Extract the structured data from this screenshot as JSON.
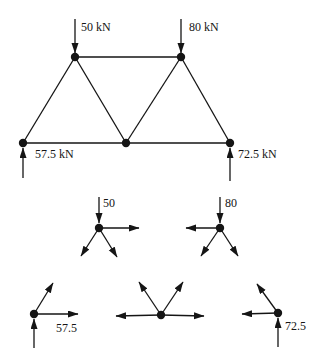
{
  "figure": {
    "type": "truss-joint-free-body-diagram",
    "units": "kN",
    "colors": {
      "ink": "#151515",
      "background": "#ffffff"
    },
    "truss": {
      "nodes": [
        {
          "id": "top-left",
          "x": 75,
          "y": 57
        },
        {
          "id": "top-right",
          "x": 181,
          "y": 57
        },
        {
          "id": "bottom-left",
          "x": 23,
          "y": 143
        },
        {
          "id": "bottom-middle",
          "x": 126,
          "y": 143
        },
        {
          "id": "bottom-right",
          "x": 230,
          "y": 143
        }
      ],
      "members": [
        {
          "name": "member-top-chord",
          "from": "top-left",
          "to": "top-right"
        },
        {
          "name": "member-bottom-chord",
          "from": "bottom-left",
          "to": "bottom-right"
        },
        {
          "name": "member-left-diagonal",
          "from": "bottom-left",
          "to": "top-left"
        },
        {
          "name": "member-mid-left-diagonal",
          "from": "top-left",
          "to": "bottom-middle"
        },
        {
          "name": "member-mid-right-diagonal",
          "from": "bottom-middle",
          "to": "top-right"
        },
        {
          "name": "member-right-diagonal",
          "from": "top-right",
          "to": "bottom-right"
        }
      ],
      "forces": [
        {
          "name": "load-arrow-50kN",
          "label": "50 kN",
          "value": 50,
          "line": [
            75,
            19,
            75,
            53
          ],
          "label_pos": [
            81,
            31
          ]
        },
        {
          "name": "load-arrow-80kN",
          "label": "80 kN",
          "value": 80,
          "line": [
            181,
            19,
            181,
            53
          ],
          "label_pos": [
            189,
            31
          ]
        },
        {
          "name": "reaction-arrow-57-5kN",
          "label": "57.5 kN",
          "value": 57.5,
          "line": [
            23,
            178,
            23,
            148
          ],
          "label_pos": [
            35,
            158
          ]
        },
        {
          "name": "reaction-arrow-72-5kN",
          "label": "72.5 kN",
          "value": 72.5,
          "line": [
            230,
            181,
            230,
            148
          ],
          "label_pos": [
            238,
            158
          ]
        }
      ]
    },
    "joint_diagrams": [
      {
        "name": "joint-fbd-top-left",
        "node": [
          99,
          228
        ],
        "arrows": [
          {
            "name": "applied-load-arrow",
            "line": [
              99,
              197,
              99,
              223
            ]
          },
          {
            "name": "member-force-arrow-right",
            "line": [
              99,
              228,
              139,
              228
            ]
          },
          {
            "name": "member-force-arrow-down-left",
            "line": [
              99,
              228,
              81,
              256
            ]
          },
          {
            "name": "member-force-arrow-down-right",
            "line": [
              99,
              228,
              117,
              257
            ]
          }
        ],
        "labels": [
          {
            "text": "50",
            "pos": [
              103,
              207
            ]
          }
        ]
      },
      {
        "name": "joint-fbd-top-right",
        "node": [
          220,
          228
        ],
        "arrows": [
          {
            "name": "applied-load-arrow",
            "line": [
              220,
              197,
              220,
              223
            ]
          },
          {
            "name": "member-force-arrow-left",
            "line": [
              220,
              228,
              186,
              228
            ]
          },
          {
            "name": "member-force-arrow-down-left",
            "line": [
              220,
              228,
              201,
              256
            ]
          },
          {
            "name": "member-force-arrow-down-right",
            "line": [
              220,
              228,
              238,
              256
            ]
          }
        ],
        "labels": [
          {
            "text": "80",
            "pos": [
              225,
              207
            ]
          }
        ]
      },
      {
        "name": "joint-fbd-bottom-left",
        "node": [
          34,
          314
        ],
        "arrows": [
          {
            "name": "member-force-arrow-up-right",
            "line": [
              34,
              314,
              53,
              283
            ]
          },
          {
            "name": "member-force-arrow-right",
            "line": [
              34,
              314,
              78,
              314
            ]
          },
          {
            "name": "reaction-arrow-up",
            "line": [
              34,
              348,
              34,
              319
            ]
          }
        ],
        "labels": [
          {
            "text": "57.5",
            "pos": [
              56,
              332
            ]
          }
        ]
      },
      {
        "name": "joint-fbd-bottom-middle",
        "node": [
          161,
          315
        ],
        "arrows": [
          {
            "name": "member-force-arrow-left",
            "line": [
              161,
              315,
              116,
              316
            ]
          },
          {
            "name": "member-force-arrow-right",
            "line": [
              161,
              315,
              204,
              316
            ]
          },
          {
            "name": "member-force-arrow-up-left",
            "line": [
              161,
              315,
              139,
              282
            ]
          },
          {
            "name": "member-force-arrow-up-right",
            "line": [
              161,
              315,
              183,
              282
            ]
          }
        ],
        "labels": []
      },
      {
        "name": "joint-fbd-bottom-right",
        "node": [
          278,
          313
        ],
        "arrows": [
          {
            "name": "member-force-arrow-up-left",
            "line": [
              278,
              313,
              257,
              284
            ]
          },
          {
            "name": "member-force-arrow-left",
            "line": [
              278,
              313,
              242,
              314
            ]
          },
          {
            "name": "reaction-arrow-up",
            "line": [
              278,
              347,
              278,
              318
            ]
          }
        ],
        "labels": [
          {
            "text": "72.5",
            "pos": [
              285,
              330
            ]
          }
        ]
      }
    ]
  }
}
